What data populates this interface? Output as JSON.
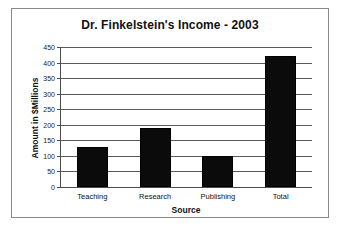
{
  "chart_data": {
    "type": "bar",
    "title": "Dr. Finkelstein's Income - 2003",
    "xlabel": "Source",
    "ylabel": "Amount in $Millions",
    "categories": [
      "Teaching",
      "Research",
      "Publishing",
      "Total"
    ],
    "values": [
      130,
      190,
      100,
      420
    ],
    "ylim": [
      0,
      450
    ],
    "ytick_step": 50,
    "yticks": [
      0,
      50,
      100,
      150,
      200,
      250,
      300,
      350,
      400,
      450
    ],
    "ytick_labels": [
      "0",
      "50",
      "100",
      "150",
      "200",
      "250",
      "300",
      "350",
      "400",
      "450"
    ],
    "grid": true,
    "legend": false,
    "legend_position": "none",
    "bar_color": "#0b0b0b",
    "gridline_color": "#5a5a5a",
    "axis_color": "#4d4d4d",
    "background_color": "#ffffff",
    "frame_color": "#8a8a8a"
  }
}
